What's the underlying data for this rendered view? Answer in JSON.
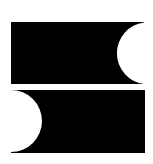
{
  "graphic": {
    "description": "Abstract logo: two black rectangles with semicircular cutouts",
    "background_color": "#ffffff",
    "fill_color": "#000000",
    "shapes": [
      {
        "name": "top-block",
        "rect": {
          "x": 11,
          "y": 22,
          "width": 133,
          "height": 62
        },
        "cutout": {
          "side": "right",
          "cx": 144,
          "cy": 53,
          "r": 31
        }
      },
      {
        "name": "bottom-block",
        "rect": {
          "x": 11,
          "y": 90,
          "width": 134,
          "height": 63
        },
        "cutout": {
          "side": "left",
          "cx": 11,
          "cy": 121,
          "r": 31
        }
      }
    ]
  }
}
